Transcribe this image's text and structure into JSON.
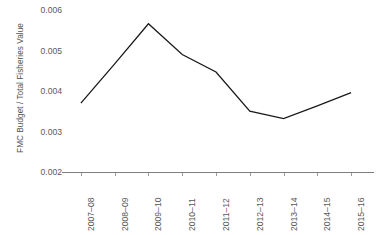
{
  "chart_data": {
    "type": "line",
    "title": "",
    "subtitle": "",
    "xlabel": "",
    "ylabel": "FMC Budget / Total Fisheries Value",
    "categories": [
      "2007–08",
      "2008–09",
      "2009–10",
      "2010–11",
      "2011–12",
      "2012–13",
      "2013–14",
      "2014–15",
      "2015–16"
    ],
    "values": [
      0.0037,
      0.00467,
      0.00566,
      0.0049,
      0.00447,
      0.0035,
      0.00332,
      0.00363,
      0.00396
    ],
    "series": [
      {
        "name": "FMC Budget / Total Fisheries Value",
        "values": [
          0.0037,
          0.00467,
          0.00566,
          0.0049,
          0.00447,
          0.0035,
          0.00332,
          0.00363,
          0.00396
        ]
      }
    ],
    "ylim": [
      0.002,
      0.006
    ],
    "yticks": [
      0.002,
      0.003,
      0.004,
      0.005,
      0.006
    ],
    "ytick_labels": [
      "0.002",
      "0.003",
      "0.004",
      "0.005",
      "0.006"
    ],
    "grid": false,
    "legend": false,
    "legend_position": "none",
    "line_color": "#1a1a1a",
    "axis_color": "#7f7f7f",
    "tick_label_color": "#5a5a5a",
    "axis_title_color": "#555555",
    "background_color": "#ffffff",
    "markers": false,
    "annotations": []
  },
  "axes": {
    "y_title": "FMC Budget / Total Fisheries Value",
    "y_tick_labels": [
      "0.006",
      "0.005",
      "0.004",
      "0.003",
      "0.002"
    ],
    "x_tick_labels": [
      "2007–08",
      "2008–09",
      "2009–10",
      "2010–11",
      "2011–12",
      "2012–13",
      "2013–14",
      "2014–15",
      "2015–16"
    ]
  }
}
